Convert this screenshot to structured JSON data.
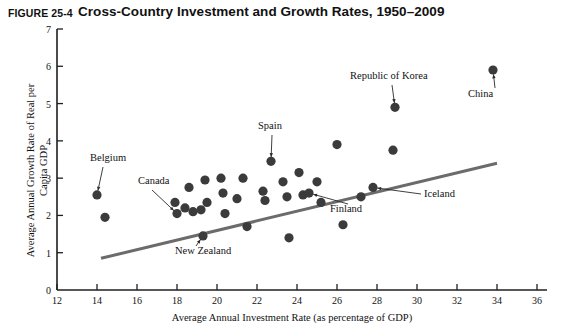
{
  "header": {
    "figure_number": "FIGURE 25-4",
    "title": "Cross-Country Investment and Growth Rates, 1950–2009"
  },
  "chart_data": {
    "type": "scatter",
    "title": "Cross-Country Investment and Growth Rates, 1950–2009",
    "xlabel": "Average Annual Investment Rate (as percentage of GDP)",
    "ylabel": "Average Annual Growth Rate of Real per Capita GDP",
    "xlim": [
      12,
      36
    ],
    "ylim": [
      0,
      7
    ],
    "xticks": [
      12,
      14,
      16,
      18,
      20,
      22,
      24,
      26,
      28,
      30,
      32,
      34,
      36
    ],
    "yticks": [
      0,
      1,
      2,
      3,
      4,
      5,
      6,
      7
    ],
    "xtick_labels": [
      "12",
      "14",
      "16",
      "18",
      "20",
      "22",
      "24",
      "26",
      "28",
      "30",
      "32",
      "34",
      "36"
    ],
    "ytick_labels": [
      "0",
      "1",
      "2",
      "3",
      "4",
      "5",
      "6",
      "7"
    ],
    "grid": false,
    "legend": false,
    "point_color": "#3b3b3b",
    "line_color": "#6b6b6b",
    "points": [
      {
        "x": 14.0,
        "y": 2.55,
        "label": "Belgium"
      },
      {
        "x": 14.4,
        "y": 1.95,
        "label": ""
      },
      {
        "x": 17.9,
        "y": 2.35,
        "label": ""
      },
      {
        "x": 18.0,
        "y": 2.05,
        "label": "Canada"
      },
      {
        "x": 18.4,
        "y": 2.2,
        "label": ""
      },
      {
        "x": 18.6,
        "y": 2.75,
        "label": ""
      },
      {
        "x": 18.8,
        "y": 2.1,
        "label": ""
      },
      {
        "x": 19.2,
        "y": 2.15,
        "label": ""
      },
      {
        "x": 19.3,
        "y": 1.45,
        "label": "New Zealand"
      },
      {
        "x": 19.4,
        "y": 2.95,
        "label": ""
      },
      {
        "x": 19.5,
        "y": 2.35,
        "label": ""
      },
      {
        "x": 20.2,
        "y": 3.0,
        "label": ""
      },
      {
        "x": 20.3,
        "y": 2.6,
        "label": ""
      },
      {
        "x": 20.4,
        "y": 2.05,
        "label": ""
      },
      {
        "x": 21.0,
        "y": 2.45,
        "label": ""
      },
      {
        "x": 21.3,
        "y": 3.0,
        "label": ""
      },
      {
        "x": 21.5,
        "y": 1.7,
        "label": ""
      },
      {
        "x": 22.3,
        "y": 2.65,
        "label": ""
      },
      {
        "x": 22.4,
        "y": 2.4,
        "label": ""
      },
      {
        "x": 22.7,
        "y": 3.45,
        "label": "Spain"
      },
      {
        "x": 23.3,
        "y": 2.9,
        "label": ""
      },
      {
        "x": 23.5,
        "y": 2.5,
        "label": ""
      },
      {
        "x": 23.6,
        "y": 1.4,
        "label": ""
      },
      {
        "x": 24.1,
        "y": 3.15,
        "label": ""
      },
      {
        "x": 24.3,
        "y": 2.55,
        "label": ""
      },
      {
        "x": 24.6,
        "y": 2.6,
        "label": "Finland"
      },
      {
        "x": 25.0,
        "y": 2.9,
        "label": ""
      },
      {
        "x": 25.2,
        "y": 2.35,
        "label": ""
      },
      {
        "x": 26.0,
        "y": 3.9,
        "label": ""
      },
      {
        "x": 26.3,
        "y": 1.75,
        "label": ""
      },
      {
        "x": 27.2,
        "y": 2.5,
        "label": ""
      },
      {
        "x": 27.8,
        "y": 2.75,
        "label": "Iceland"
      },
      {
        "x": 28.8,
        "y": 3.75,
        "label": ""
      },
      {
        "x": 28.9,
        "y": 4.9,
        "label": "Republic of Korea"
      },
      {
        "x": 33.8,
        "y": 5.9,
        "label": "China"
      }
    ],
    "trendline": {
      "x0": 14.2,
      "y0": 0.85,
      "x1": 34.0,
      "y1": 3.4
    },
    "annotations": [
      {
        "text": "Belgium",
        "target_x": 14.0,
        "target_y": 2.55
      },
      {
        "text": "Canada",
        "target_x": 18.0,
        "target_y": 2.05
      },
      {
        "text": "New Zealand",
        "target_x": 19.3,
        "target_y": 1.45
      },
      {
        "text": "Spain",
        "target_x": 22.7,
        "target_y": 3.45
      },
      {
        "text": "Finland",
        "target_x": 24.6,
        "target_y": 2.6
      },
      {
        "text": "Iceland",
        "target_x": 27.8,
        "target_y": 2.75
      },
      {
        "text": "Republic of Korea",
        "target_x": 28.9,
        "target_y": 4.9
      },
      {
        "text": "China",
        "target_x": 33.8,
        "target_y": 5.9
      }
    ]
  }
}
